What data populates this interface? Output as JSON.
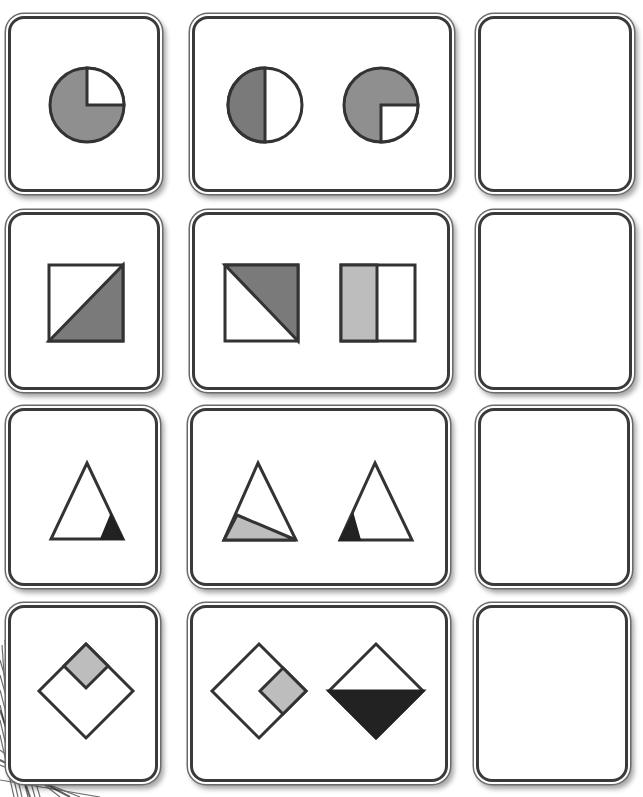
{
  "puzzle": {
    "layout": {
      "rows": 4,
      "columns": 3
    },
    "colors": {
      "stroke": "#333333",
      "dark_gray": "#7a7a7a",
      "mid_gray": "#8f8f8f",
      "light_gray": "#bdbdbd",
      "black": "#222222",
      "white": "#ffffff"
    },
    "rows": [
      {
        "example": {
          "shape": "circle",
          "shaded": "three-quarters (top-right quarter white)",
          "fill": "mid_gray"
        },
        "pair": [
          {
            "shape": "circle",
            "shaded": "left half",
            "fill": "dark_gray"
          },
          {
            "shape": "circle",
            "shaded": "three-quarters (bottom-right quarter white)",
            "fill": "mid_gray"
          }
        ],
        "answer": "empty"
      },
      {
        "example": {
          "shape": "square",
          "shaded": "lower-right triangle",
          "fill": "dark_gray"
        },
        "pair": [
          {
            "shape": "square",
            "shaded": "upper-right triangle",
            "fill": "dark_gray"
          },
          {
            "shape": "rectangle",
            "shaded": "left half",
            "fill": "light_gray"
          }
        ],
        "answer": "empty"
      },
      {
        "example": {
          "shape": "triangle",
          "shaded": "small bottom-right corner",
          "fill": "black"
        },
        "pair": [
          {
            "shape": "triangle",
            "shaded": "bottom-left wedge",
            "fill": "light_gray"
          },
          {
            "shape": "triangle",
            "shaded": "small bottom-left corner",
            "fill": "black"
          }
        ],
        "answer": "empty"
      },
      {
        "example": {
          "shape": "diamond",
          "shaded": "top quarter diamond",
          "fill": "light_gray"
        },
        "pair": [
          {
            "shape": "diamond",
            "shaded": "right quarter diamond",
            "fill": "light_gray"
          },
          {
            "shape": "diamond",
            "shaded": "bottom half",
            "fill": "black"
          }
        ],
        "answer": "empty"
      }
    ]
  }
}
